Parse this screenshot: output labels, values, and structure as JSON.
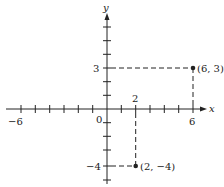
{
  "diagram": {
    "type": "coordinate-plane",
    "axes": {
      "x_label": "x",
      "y_label": "y",
      "origin_label": "0",
      "x_range": [
        -6,
        6
      ],
      "y_range": [
        -5,
        6
      ],
      "x_tick_labels": [
        {
          "value": -6,
          "text": "−6"
        },
        {
          "value": 2,
          "text": "2"
        },
        {
          "value": 6,
          "text": "6"
        }
      ],
      "y_tick_labels": [
        {
          "value": 3,
          "text": "3"
        },
        {
          "value": -4,
          "text": "−4"
        }
      ]
    },
    "points": [
      {
        "x": 6,
        "y": 3,
        "label": "(6, 3)"
      },
      {
        "x": 2,
        "y": -4,
        "label": "(2, −4)"
      }
    ],
    "colors": {
      "ink": "#222222",
      "background": "#ffffff"
    }
  }
}
